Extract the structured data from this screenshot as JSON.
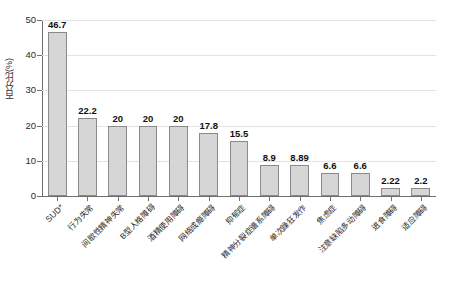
{
  "chart_data": {
    "type": "bar",
    "title": "",
    "subtitle": "",
    "xlabel": "",
    "ylabel": "百分比(%)",
    "ylim": [
      0,
      50
    ],
    "ytick_values": [
      0,
      10,
      20,
      30,
      40,
      50
    ],
    "ytick_labels": [
      "0",
      "10",
      "20",
      "30",
      "40",
      "50"
    ],
    "grid": "horizontal",
    "legend": "none",
    "bar_color": "#d6d6d6",
    "bar_border_color": "#8a8a8a",
    "gridline_color": "#e3e3e3",
    "axis_color": "#6e6e6e",
    "categories": [
      "SUD*",
      "行为失常",
      "间歇性精神失常",
      "B型人格障碍",
      "酒精使用障碍",
      "网络成瘾障碍",
      "抑郁症",
      "精神分裂症谱系障碍",
      "单次躁狂发作",
      "焦虑症",
      "注意缺陷多动障碍",
      "进食障碍",
      "适应障碍"
    ],
    "values": [
      46.7,
      22.2,
      20,
      20,
      20,
      17.8,
      15.5,
      8.9,
      8.89,
      6.6,
      6.6,
      2.22,
      2.2
    ],
    "value_labels": [
      "46.7",
      "22.2",
      "20",
      "20",
      "20",
      "17.8",
      "15.5",
      "8.9",
      "8.89",
      "6.6",
      "6.6",
      "2.22",
      "2.2"
    ]
  }
}
